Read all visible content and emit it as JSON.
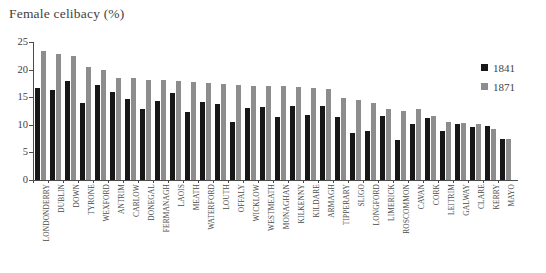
{
  "chart_data": {
    "type": "bar",
    "title": "Female celibacy (%)",
    "xlabel": "",
    "ylabel": "",
    "ylim": [
      0,
      25
    ],
    "yticks": [
      0,
      5,
      10,
      15,
      20,
      25
    ],
    "grid": false,
    "legend_position": "top-right",
    "orientation": "vertical",
    "bar_mode": "grouped",
    "categories": [
      "LONDONDERRY",
      "DUBLIN",
      "DOWN",
      "TYRONE",
      "WEXFORD",
      "ANTRIM",
      "CARLOW",
      "DONEGAL",
      "FERMANAGH",
      "LAOIS",
      "MEATH",
      "WATERFORD",
      "LOUTH",
      "OFFALY",
      "WICKLOW",
      "WESTMEATH",
      "MONAGHAN",
      "KILKENNY",
      "KILDARE",
      "ARMAGH",
      "TIPPERARY",
      "SLIGO",
      "LONGFORD",
      "LIMERICK",
      "ROSCOMMON",
      "CAVAN",
      "CORK",
      "LEITRIM",
      "GALWAY",
      "CLARE",
      "KERRY",
      "MAYO"
    ],
    "series": [
      {
        "name": "1841",
        "color": "#171717",
        "values": [
          16.6,
          16.3,
          17.9,
          13.9,
          17.3,
          16.0,
          14.7,
          12.9,
          14.3,
          15.7,
          12.3,
          14.2,
          13.7,
          10.5,
          13.1,
          13.3,
          11.4,
          13.4,
          11.8,
          13.4,
          11.5,
          8.6,
          8.8,
          11.6,
          7.3,
          10.2,
          11.3,
          8.8,
          10.1,
          9.6,
          9.7,
          7.4
        ]
      },
      {
        "name": "1871",
        "color": "#8d8d8d",
        "values": [
          23.3,
          22.8,
          22.4,
          20.5,
          20.0,
          18.5,
          18.4,
          18.1,
          18.1,
          17.9,
          17.7,
          17.6,
          17.4,
          17.2,
          17.1,
          17.1,
          17.0,
          16.8,
          16.7,
          16.5,
          14.8,
          14.5,
          13.9,
          12.9,
          12.5,
          12.8,
          11.6,
          10.6,
          10.4,
          10.2,
          9.3,
          7.5
        ]
      }
    ]
  },
  "legend": {
    "items": [
      {
        "label": "1841",
        "color": "#171717"
      },
      {
        "label": "1871",
        "color": "#8d8d8d"
      }
    ]
  },
  "axis": {
    "y_tick_labels": [
      "0",
      "5",
      "10",
      "15",
      "20",
      "25"
    ]
  }
}
